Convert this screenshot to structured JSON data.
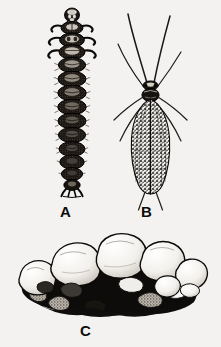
{
  "plate": {
    "background_color": "#f3f2f0",
    "ink_color": "#111111",
    "width": 221,
    "height": 347,
    "caption_style": "bold-sans-capital-letter"
  },
  "figures": [
    {
      "key": "A",
      "label": "A",
      "subject": "caddisfly-larva-dorsal-view",
      "description": "Segmented larva seen from above, dark head capsule, three pairs of hooked thoracic legs, eight rounded abdominal segments, terminal anal prolegs",
      "label_x": 60,
      "label_y": 204
    },
    {
      "key": "B",
      "label": "B",
      "subject": "caddisfly-adult-dorsal-view",
      "description": "Adult with two long filamentous antennae, mottled speckled wings folded over abdomen, slender legs extended laterally",
      "label_x": 141,
      "label_y": 204
    },
    {
      "key": "C",
      "label": "C",
      "subject": "caddisfly-larval-case-of-pebbles",
      "description": "Tubular larval case built from rounded pebbles and sand grains, pale stones above with dark shaded interior below",
      "label_x": 80,
      "label_y": 323
    }
  ]
}
